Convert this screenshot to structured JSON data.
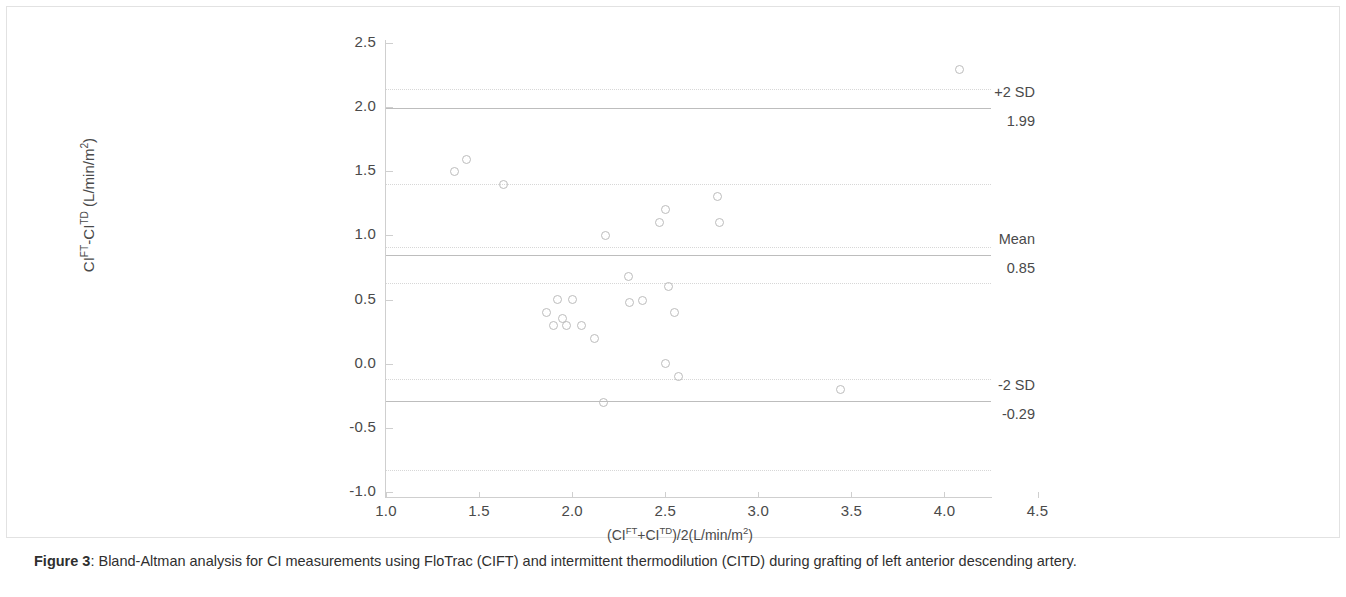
{
  "figure": {
    "caption_label": "Figure 3",
    "caption_sep": ": ",
    "caption_text": "Bland-Altman analysis for CI measurements using FloTrac (CIFT) and intermittent thermodilution (CITD) during grafting of left anterior descending artery."
  },
  "annotations": [
    {
      "name": "plus-2-sd",
      "label": "+2 SD",
      "value": "1.99",
      "y": 1.99
    },
    {
      "name": "mean",
      "label": "Mean",
      "value": "0.85",
      "y": 0.85
    },
    {
      "name": "minus-2-sd",
      "label": "-2 SD",
      "value": "-0.29",
      "y": -0.29
    }
  ],
  "colors": {
    "marker_stroke": "#bcbcbc",
    "reference_line": "#d7d7d7",
    "limit_line": "#bdbdbd",
    "axis": "#cfcfcf",
    "text": "#4a4a4a",
    "background": "#ffffff"
  },
  "chart_data": {
    "type": "scatter",
    "title": "",
    "xlabel": "(CI^FT+CI^TD)/2(L/min/m2)",
    "xlabel_parts": {
      "pre": "(CI",
      "sup1": "FT",
      "mid": "+CI",
      "sup2": "TD",
      "post": ")/2(L/min/m",
      "sup3": "2",
      "end": ")"
    },
    "ylabel": "CI^FT-CI^TD (L/min/m2)",
    "ylabel_parts": {
      "pre": "CI",
      "sup1": "FT",
      "mid": "-CI",
      "sup2": "TD",
      "post": " (L/min/m",
      "sup3": "2",
      "end": ")"
    },
    "xlim": [
      1.0,
      4.25
    ],
    "ylim": [
      -1.0,
      2.5
    ],
    "xticks": [
      1.0,
      1.5,
      2.0,
      2.5,
      3.0,
      3.5,
      4.0,
      4.5
    ],
    "xticklabels": [
      "1.0",
      "1.5",
      "2.0",
      "2.5",
      "3.0",
      "3.5",
      "4.0",
      "4.5"
    ],
    "yticks": [
      2.5,
      2.0,
      1.5,
      1.0,
      0.5,
      0.0,
      -0.5,
      -1.0
    ],
    "yticklabels": [
      "2.5",
      "2.0",
      "1.5",
      "1.0",
      "0.5",
      "0.0",
      "-0.5",
      "-1.0"
    ],
    "grid": false,
    "legend": "none",
    "marker": "open-circle",
    "points": [
      {
        "x": 1.37,
        "y": 1.5
      },
      {
        "x": 1.43,
        "y": 1.59
      },
      {
        "x": 1.63,
        "y": 1.4
      },
      {
        "x": 1.86,
        "y": 0.4
      },
      {
        "x": 1.9,
        "y": 0.3
      },
      {
        "x": 1.92,
        "y": 0.5
      },
      {
        "x": 1.95,
        "y": 0.35
      },
      {
        "x": 1.97,
        "y": 0.3
      },
      {
        "x": 2.0,
        "y": 0.5
      },
      {
        "x": 2.05,
        "y": 0.3
      },
      {
        "x": 2.12,
        "y": 0.2
      },
      {
        "x": 2.17,
        "y": -0.3
      },
      {
        "x": 2.18,
        "y": 1.0
      },
      {
        "x": 2.3,
        "y": 0.68
      },
      {
        "x": 2.31,
        "y": 0.48
      },
      {
        "x": 2.38,
        "y": 0.49
      },
      {
        "x": 2.47,
        "y": 1.1
      },
      {
        "x": 2.5,
        "y": 1.2
      },
      {
        "x": 2.52,
        "y": 0.6
      },
      {
        "x": 2.5,
        "y": 0.0
      },
      {
        "x": 2.55,
        "y": 0.4
      },
      {
        "x": 2.57,
        "y": -0.1
      },
      {
        "x": 2.78,
        "y": 1.3
      },
      {
        "x": 2.79,
        "y": 1.1
      },
      {
        "x": 3.44,
        "y": -0.2
      },
      {
        "x": 4.08,
        "y": 2.29
      }
    ],
    "reference_lines": [
      {
        "name": "upper-outer",
        "y": 2.14,
        "style": "dotted"
      },
      {
        "name": "plus-2-sd",
        "y": 1.99,
        "style": "solid"
      },
      {
        "name": "upper-inner",
        "y": 1.4,
        "style": "dotted"
      },
      {
        "name": "mean-upper",
        "y": 0.91,
        "style": "dotted"
      },
      {
        "name": "mean",
        "y": 0.85,
        "style": "solid"
      },
      {
        "name": "mean-lower",
        "y": 0.63,
        "style": "dotted"
      },
      {
        "name": "lower-inner",
        "y": -0.12,
        "style": "dotted"
      },
      {
        "name": "minus-2-sd",
        "y": -0.29,
        "style": "solid"
      },
      {
        "name": "lower-outer",
        "y": -0.83,
        "style": "dotted"
      }
    ]
  }
}
